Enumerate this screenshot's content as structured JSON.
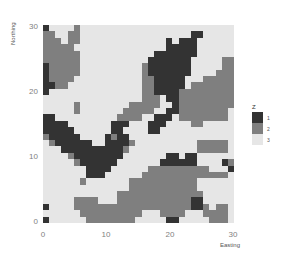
{
  "chart_data": {
    "type": "heatmap",
    "title": "",
    "xlabel": "Easting",
    "ylabel": "Northing",
    "xlim": [
      0,
      30
    ],
    "ylim": [
      0,
      30
    ],
    "x_ticks": [
      "0",
      "10",
      "20",
      "30"
    ],
    "y_ticks": [
      "0",
      "10",
      "20",
      "30"
    ],
    "legend": {
      "title": "Z",
      "position": "right",
      "entries": [
        {
          "label": "1",
          "color": "#333333"
        },
        {
          "label": "2",
          "color": "#7f7f7f"
        },
        {
          "label": "3",
          "color": "#e6e6e6"
        }
      ]
    },
    "grid": false,
    "rows_top_to_bottom_northing_30_to_0": [
      "1333323333333333333333333333333",
      "2233223333333333333333331133333",
      "2223223333333333333313111333333",
      "2222233333333333333311111333333",
      "2222223333333333331111111333333",
      "2222223333333333311111113333322",
      "1222223333333333211111113333322",
      "1222223333333333211111113333222",
      "1222233333333333221111133322222",
      "1122333333333333221111132222222",
      "1333333333333333221111222222222",
      "3333363333333333222311222222222",
      "3333323333333322222331222222222",
      "3333323333333222223311222222223",
      "1133333333332222331113222222223",
      "1111333333311133311133332233333",
      "1111133333311333311333333333333",
      "2111113333121133333333333333333",
      "3211111133111123333333333222223",
      "3331111111111233333333333222223",
      "3333211111111333333311311333333",
      "3333321111113333333111111333312",
      "3333333111133333322222222223331",
      "3333333111333333222222222222223",
      "3333332333333322222222222333333",
      "3333333333333322222222222333333",
      "3333333333332222222222222233333",
      "3333322223332222222222221133333",
      "1333322222222222222222221123223",
      "3333332222222222333222233322223",
      "1333333222222223333311333332223"
    ]
  }
}
